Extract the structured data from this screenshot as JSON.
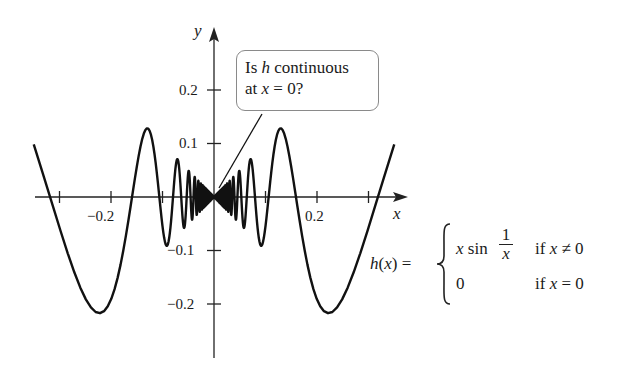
{
  "chart_data": {
    "type": "line",
    "title": "",
    "function": "h(x) = x sin(1/x) for x != 0; h(0) = 0",
    "xlabel": "x",
    "ylabel": "y",
    "xlim": [
      -0.35,
      0.37
    ],
    "ylim": [
      -0.3,
      0.32
    ],
    "x_ticks": [
      -0.3,
      -0.2,
      -0.1,
      0.1,
      0.2,
      0.3
    ],
    "x_tick_labels": [
      {
        "value": -0.2,
        "label": "−0.2"
      },
      {
        "value": 0.2,
        "label": "0.2"
      }
    ],
    "y_ticks": [
      0.2,
      0.1,
      -0.1,
      -0.2
    ],
    "y_tick_labels": [
      {
        "value": 0.2,
        "label": "0.2"
      },
      {
        "value": 0.1,
        "label": "0.1"
      },
      {
        "value": -0.1,
        "label": "−0.1"
      },
      {
        "value": -0.2,
        "label": "−0.2"
      }
    ],
    "grid": false,
    "legend": null,
    "series": [
      {
        "name": "h(x)",
        "x_range": [
          -0.35,
          0.35
        ],
        "sample_points": [
          {
            "x": -0.35,
            "y": 0.098
          },
          {
            "x": -0.318,
            "y": 0.0
          },
          {
            "x": -0.22,
            "y": -0.217
          },
          {
            "x": -0.159,
            "y": 0.0
          },
          {
            "x": -0.13,
            "y": 0.128
          },
          {
            "x": -0.106,
            "y": 0.0
          },
          {
            "x": -0.09,
            "y": -0.09
          },
          {
            "x": -0.08,
            "y": 0.0
          },
          {
            "x": 0.0,
            "y": 0.0
          },
          {
            "x": 0.08,
            "y": 0.0
          },
          {
            "x": 0.09,
            "y": -0.09
          },
          {
            "x": 0.106,
            "y": 0.0
          },
          {
            "x": 0.13,
            "y": 0.128
          },
          {
            "x": 0.159,
            "y": 0.0
          },
          {
            "x": 0.22,
            "y": -0.217
          },
          {
            "x": 0.318,
            "y": 0.0
          },
          {
            "x": 0.35,
            "y": 0.098
          }
        ]
      }
    ],
    "annotations": [
      {
        "type": "callout",
        "text": "Is h continuous at x = 0?",
        "points_to": {
          "x": 0.0,
          "y": 0.0
        }
      }
    ],
    "layout": {
      "origin_px": [
        214,
        197
      ],
      "x_px_per_unit": 515,
      "y_px_per_unit": 535
    }
  },
  "axes": {
    "x_label": "x",
    "y_label": "y",
    "x_tick_labels": [
      "−0.2",
      "0.2"
    ],
    "y_tick_labels": [
      "0.2",
      "0.1",
      "−0.1",
      "−0.2"
    ]
  },
  "callout": {
    "line1_pre": "Is ",
    "line1_var": "h",
    "line1_post": " continuous",
    "line2_pre": "at ",
    "line2_var": "x",
    "line2_post": " = 0?"
  },
  "formula": {
    "lhs_fn": "h",
    "lhs_open": "(",
    "lhs_var": "x",
    "lhs_close": ") =",
    "case1_expr_var": "x",
    "case1_expr_fn": " sin",
    "case1_frac_num": "1",
    "case1_frac_den": "x",
    "case1_cond_pre": "if ",
    "case1_cond_var": "x",
    "case1_cond_post": " ≠ 0",
    "case2_expr": "0",
    "case2_cond_pre": "if ",
    "case2_cond_var": "x",
    "case2_cond_post": " = 0"
  },
  "colors": {
    "curve": "#111111",
    "axes": "#222222",
    "callout_border": "#8a8a8a",
    "background": "#ffffff"
  }
}
